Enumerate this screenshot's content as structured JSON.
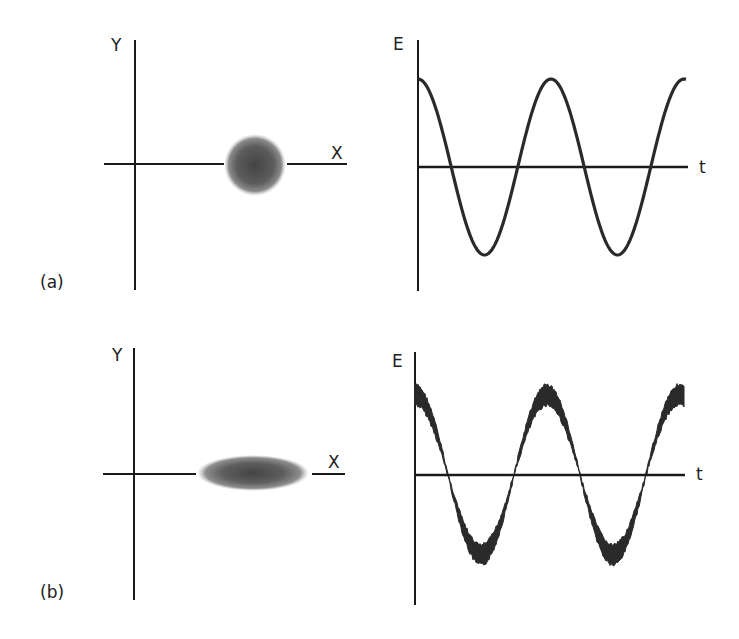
{
  "figure": {
    "panels": [
      {
        "id": "a",
        "label": "(a)",
        "polarization_plot": {
          "y_axis_label": "Y",
          "x_axis_label": "X",
          "spot_shape": "circle"
        },
        "field_plot": {
          "y_axis_label": "E",
          "x_axis_label": "t",
          "waveform": "cosine",
          "noise": "low"
        }
      },
      {
        "id": "b",
        "label": "(b)",
        "polarization_plot": {
          "y_axis_label": "Y",
          "x_axis_label": "X",
          "spot_shape": "ellipse (squeezed along Y)"
        },
        "field_plot": {
          "y_axis_label": "E",
          "x_axis_label": "t",
          "waveform": "cosine",
          "noise": "phase-dependent (large at peaks, small at zero crossings)"
        }
      }
    ],
    "colors": {
      "axis": "#1a1a1a",
      "wave": "#2a2a2a",
      "spot": "#555555",
      "background": "#ffffff"
    }
  }
}
